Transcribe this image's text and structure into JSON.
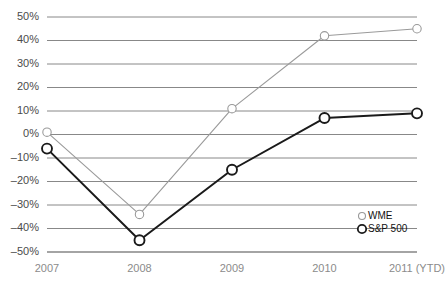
{
  "chart_data": {
    "type": "line",
    "title": "",
    "subtitle": "",
    "xlabel": "",
    "ylabel": "",
    "categories": [
      "2007",
      "2008",
      "2009",
      "2010",
      "2011 (YTD)"
    ],
    "series": [
      {
        "name": "WME",
        "color": "#9a9a9a",
        "marker": "open-circle",
        "values": [
          1,
          -34,
          11,
          42,
          45
        ]
      },
      {
        "name": "S&P 500",
        "color": "#1a1a1a",
        "marker": "open-circle",
        "values": [
          -6,
          -45,
          -15,
          7,
          9
        ]
      }
    ],
    "ylim": [
      -50,
      50
    ],
    "ytick_values": [
      50,
      40,
      30,
      20,
      10,
      0,
      -10,
      -20,
      -30,
      -40,
      -50
    ],
    "ytick_labels": [
      "50%",
      "40%",
      "30%",
      "20%",
      "10%",
      "0%",
      "–10%",
      "–20%",
      "–30%",
      "–40%",
      "–50%"
    ],
    "grid": true,
    "grid_axis": "y",
    "legend_position": "bottom-right",
    "legend_entries": [
      {
        "label": "WME",
        "color": "#9a9a9a"
      },
      {
        "label": "S&P 500",
        "color": "#1a1a1a"
      }
    ]
  },
  "axes": {
    "y_labels": [
      "50%",
      "40%",
      "30%",
      "20%",
      "10%",
      "0%",
      "–10%",
      "–20%",
      "–30%",
      "–40%",
      "–50%"
    ],
    "x_labels": [
      "2007",
      "2008",
      "2009",
      "2010",
      "2011 (YTD)"
    ]
  },
  "legend": {
    "wme_label": "WME",
    "sp500_label": "S&P 500"
  }
}
